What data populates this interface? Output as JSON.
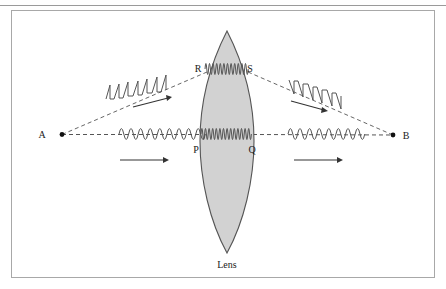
{
  "figure": {
    "type": "optics-ray-diagram",
    "caption": "Lens",
    "background_color": "#ffffff",
    "frame": {
      "outer_rule_color": "#9a9a9a",
      "inner_border_color": "#a8a8a8"
    },
    "points": {
      "A": {
        "label": "A",
        "x": 62,
        "y": 134,
        "marker": "filled-dot"
      },
      "B": {
        "label": "B",
        "x": 393,
        "y": 135,
        "marker": "filled-dot"
      },
      "P": {
        "label": "P",
        "x": 196,
        "y": 150
      },
      "Q": {
        "label": "Q",
        "x": 251,
        "y": 150
      },
      "R": {
        "label": "R",
        "x": 198,
        "y": 69
      },
      "S": {
        "label": "S",
        "x": 249,
        "y": 69
      }
    },
    "lens": {
      "label": "Lens",
      "fill_color": "#d2d2d2",
      "stroke_color": "#555555",
      "center_x": 227,
      "top_y": 31,
      "bottom_y": 253,
      "half_width": 27
    },
    "rays": [
      {
        "name": "axis-ray-A-to-P",
        "style": "dashed",
        "from": "A",
        "to": "P"
      },
      {
        "name": "axis-ray-Q-to-B",
        "style": "dashed",
        "from": "Q",
        "to": "B"
      },
      {
        "name": "oblique-ray-A-to-R",
        "style": "dashed",
        "from": "A",
        "to": "R"
      },
      {
        "name": "oblique-ray-S-to-B",
        "style": "dashed",
        "from": "S",
        "to": "B"
      }
    ],
    "waves": [
      {
        "name": "incident-wave-axis-left",
        "shape": "sine",
        "region": "left of lens, on optical axis",
        "cycles": 4.5,
        "amplitude": 11,
        "wavelength_px": 19
      },
      {
        "name": "incident-wave-oblique-upper-left",
        "shape": "sawtooth",
        "region": "left of lens, upper oblique ray",
        "cycles": 4.5,
        "amplitude": 14,
        "wavelength_px": 19
      },
      {
        "name": "wave-inside-lens-axis",
        "shape": "sine",
        "region": "inside lens, on optical axis, between P and Q",
        "cycles": 8,
        "amplitude": 11,
        "wavelength_px": 7,
        "note": "shorter wavelength inside denser medium"
      },
      {
        "name": "wave-inside-lens-upper",
        "shape": "sine",
        "region": "inside lens, between R and S",
        "cycles": 7,
        "amplitude": 11,
        "wavelength_px": 7,
        "note": "shorter wavelength inside denser medium"
      },
      {
        "name": "emergent-wave-axis-right",
        "shape": "sine",
        "region": "right of lens, on optical axis",
        "cycles": 4,
        "amplitude": 11,
        "wavelength_px": 19
      },
      {
        "name": "emergent-wave-oblique-upper-right",
        "shape": "sawtooth",
        "region": "right of lens, upper oblique ray converging to B",
        "cycles": 4,
        "amplitude": 14,
        "wavelength_px": 19
      }
    ],
    "direction_arrows": [
      {
        "name": "arrow-axis-left",
        "direction": "right",
        "x1": 120,
        "y1": 160,
        "x2": 168,
        "y2": 160
      },
      {
        "name": "arrow-oblique-left",
        "direction": "up-right",
        "x1": 133,
        "y1": 106,
        "x2": 171,
        "y2": 97
      },
      {
        "name": "arrow-axis-right",
        "direction": "right",
        "x1": 294,
        "y1": 160,
        "x2": 342,
        "y2": 160
      },
      {
        "name": "arrow-oblique-right",
        "direction": "down-right",
        "x1": 291,
        "y1": 101,
        "x2": 327,
        "y2": 110
      }
    ],
    "colors": {
      "ink": "#1a1a1a",
      "wave_stroke": "#555555",
      "ray_stroke": "#555555"
    }
  }
}
